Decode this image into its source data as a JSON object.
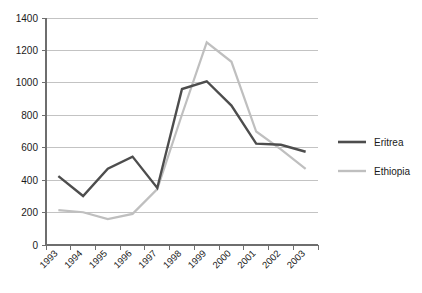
{
  "chart_data": {
    "type": "line",
    "title": "",
    "xlabel": "",
    "ylabel": "",
    "categories": [
      "1993",
      "1994",
      "1995",
      "1996",
      "1997",
      "1998",
      "1999",
      "2000",
      "2001",
      "2002",
      "2003"
    ],
    "x": [
      "1993",
      "1994",
      "1995",
      "1996",
      "1997",
      "1998",
      "1999",
      "2000",
      "2001",
      "2002",
      "2003"
    ],
    "ylim": [
      0,
      1400
    ],
    "ytick_labels": [
      "0",
      "200",
      "400",
      "600",
      "800",
      "1000",
      "1200",
      "1400"
    ],
    "ytick_values": [
      0,
      200,
      400,
      600,
      800,
      1000,
      1200,
      1400
    ],
    "grid": true,
    "legend_position": "right",
    "series": [
      {
        "name": "Eritrea",
        "color": "#4d4d4d",
        "values": [
          425,
          302,
          470,
          545,
          352,
          962,
          1010,
          860,
          625,
          618,
          575
        ]
      },
      {
        "name": "Ethiopia",
        "color": "#bfbfbf",
        "values": [
          215,
          202,
          160,
          192,
          345,
          805,
          1250,
          1130,
          700,
          590,
          470
        ]
      }
    ]
  },
  "legend": {
    "items": [
      {
        "label": "Eritrea"
      },
      {
        "label": "Ethiopia"
      }
    ]
  }
}
